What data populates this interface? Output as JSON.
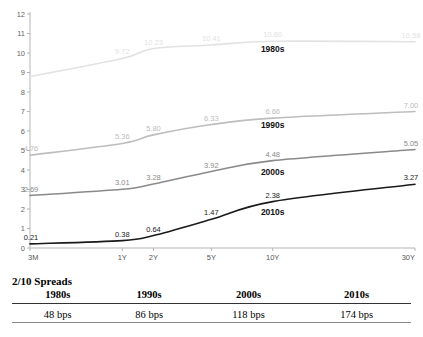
{
  "chart_data": {
    "type": "line",
    "title": "",
    "xlabel": "",
    "ylabel": "",
    "categories": [
      "3M",
      "1Y",
      "2Y",
      "5Y",
      "10Y",
      "30Y"
    ],
    "x_positions": [
      0,
      1,
      2,
      5,
      10,
      30
    ],
    "ylim": [
      0,
      12
    ],
    "xlim": [
      0,
      30
    ],
    "y_ticks": [
      "0",
      "1",
      "2",
      "3",
      "4",
      "5",
      "6",
      "7",
      "8",
      "9",
      "10",
      "11",
      "12"
    ],
    "grid": false,
    "legend": "inline-labels",
    "series": [
      {
        "name": "1980s",
        "color": "#e2e2e2",
        "values": [
          8.79,
          9.72,
          10.23,
          10.41,
          10.6,
          10.58
        ],
        "labels": [
          "8.79",
          "9.72",
          "10.23",
          "10.41",
          "10.60",
          "10.58"
        ],
        "label_visible": [
          false,
          true,
          true,
          true,
          true,
          true
        ],
        "name_x": 10.0,
        "name_y": 10.05
      },
      {
        "name": "1990s",
        "color": "#bdbdbd",
        "values": [
          4.76,
          5.36,
          5.8,
          6.33,
          6.66,
          7.0
        ],
        "labels": [
          "4.76",
          "5.36",
          "5.80",
          "6.33",
          "6.66",
          "7.00"
        ],
        "label_visible": [
          true,
          true,
          true,
          true,
          true,
          true
        ],
        "name_x": 10.0,
        "name_y": 6.13
      },
      {
        "name": "2000s",
        "color": "#8a8a8a",
        "values": [
          2.69,
          3.01,
          3.28,
          3.92,
          4.48,
          5.05
        ],
        "labels": [
          "2.69",
          "3.01",
          "3.28",
          "3.92",
          "4.48",
          "5.05"
        ],
        "label_visible": [
          true,
          true,
          true,
          true,
          true,
          true
        ],
        "name_x": 10.0,
        "name_y": 3.72
      },
      {
        "name": "2010s",
        "color": "#1a1a1a",
        "values": [
          0.21,
          0.38,
          0.64,
          1.47,
          2.38,
          3.27
        ],
        "labels": [
          "0.21",
          "0.38",
          "0.64",
          "1.47",
          "2.38",
          "3.27"
        ],
        "label_visible": [
          true,
          true,
          true,
          true,
          true,
          true
        ],
        "name_x": 10.0,
        "name_y": 1.7
      }
    ]
  },
  "spreads": {
    "title": "2/10 Spreads",
    "columns": [
      "1980s",
      "1990s",
      "2000s",
      "2010s"
    ],
    "values": [
      "48 bps",
      "86 bps",
      "118 bps",
      "174 bps"
    ]
  }
}
